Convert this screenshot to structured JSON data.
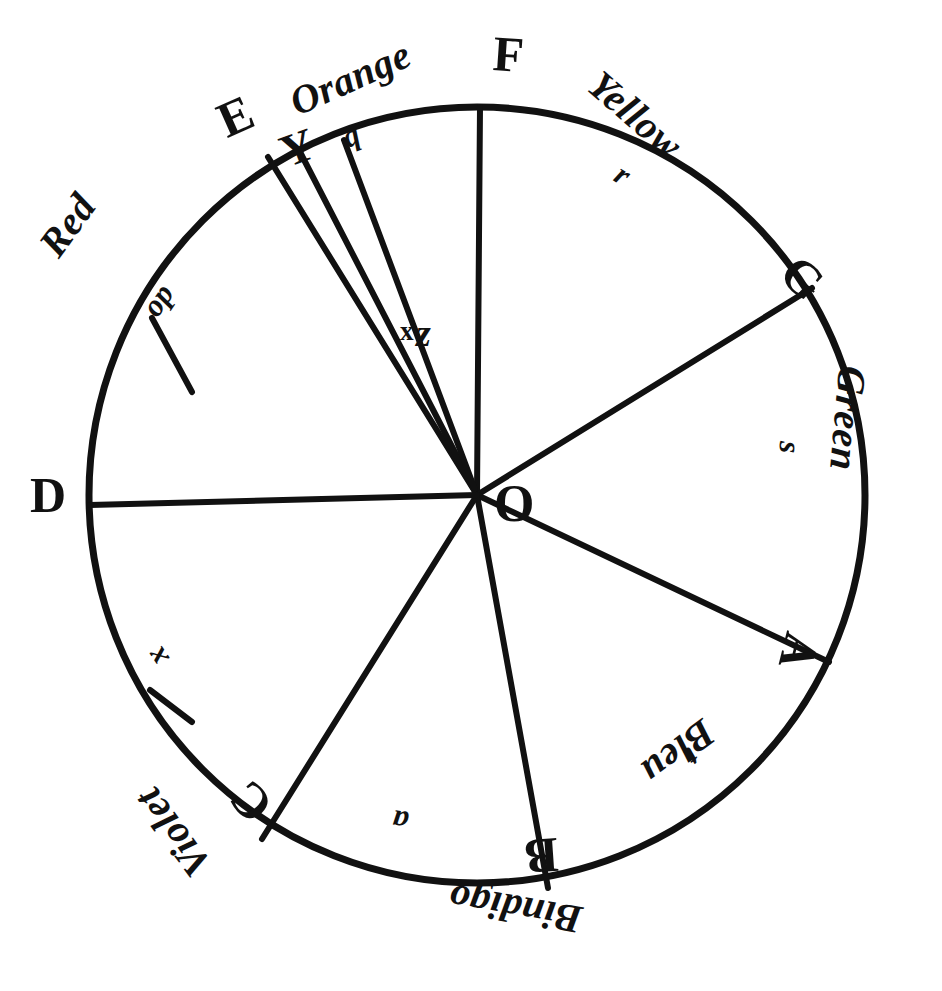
{
  "figure": {
    "center_label": "O",
    "ink_color": "#111111",
    "paper_color": "#ffffff",
    "geometry": {
      "center_x": 477,
      "center_y": 495,
      "radius": 388
    }
  },
  "colours": [
    {
      "name": "Red",
      "vertex_start": "D",
      "vertex_end": "E",
      "division_letter": "op"
    },
    {
      "name": "Orange",
      "vertex_start": "E",
      "vertex_end": "F",
      "division_letter": "q"
    },
    {
      "name": "Yellow",
      "vertex_start": "F",
      "vertex_end": "G",
      "division_letter": "r"
    },
    {
      "name": "Green",
      "vertex_start": "G",
      "vertex_end": "A",
      "division_letter": "s"
    },
    {
      "name": "Bleu",
      "vertex_start": "A",
      "vertex_end": "B",
      "division_letter": "t"
    },
    {
      "name": "Bindigo",
      "vertex_start": "B",
      "vertex_end": "C",
      "division_letter": "a"
    },
    {
      "name": "Violet",
      "vertex_start": "C",
      "vertex_end": "D",
      "division_letter": "x"
    }
  ],
  "vertices": [
    {
      "label": "D",
      "angle_deg": 180
    },
    {
      "label": "E",
      "angle_deg": 117
    },
    {
      "label": "F",
      "angle_deg": 90
    },
    {
      "label": "G",
      "angle_deg": 30
    },
    {
      "label": "A",
      "angle_deg": -25
    },
    {
      "label": "B",
      "angle_deg": -79
    },
    {
      "label": "C",
      "angle_deg": -124
    }
  ],
  "inner_marks": [
    {
      "label": "x"
    },
    {
      "label": "z"
    },
    {
      "label": "Y"
    }
  ],
  "labels": {
    "red": "Red",
    "orange": "Orange",
    "yellow": "Yellow",
    "green": "Green",
    "bleu": "Bleu",
    "indigo": "Bindigo",
    "violet": "Violet",
    "vertex_a": "A",
    "vertex_b": "B",
    "vertex_c": "C",
    "vertex_d": "D",
    "vertex_e": "E",
    "vertex_f": "F",
    "vertex_g": "G",
    "centre_o": "O",
    "mark_x": "x",
    "mark_z": "z",
    "mark_y": "Y",
    "div_op": "op",
    "div_q": "q",
    "div_r": "r",
    "div_s": "s",
    "div_t": "t",
    "div_a": "a",
    "div_x": "x"
  }
}
